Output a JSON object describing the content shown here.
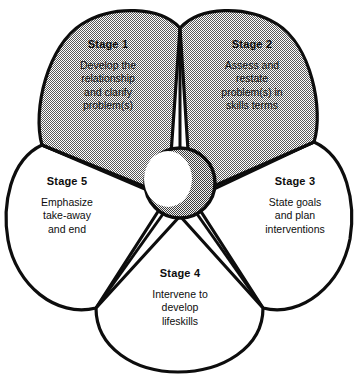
{
  "diagram": {
    "type": "five-stage-flower-cycle",
    "background_color": "#ffffff",
    "outline_color": "#0d0d0d",
    "shaded_fill_color": "#bdbdbd",
    "unshaded_fill_color": "#ffffff",
    "hub_fill_color": "#9a9a9a",
    "hub_highlight_color": "#ffffff",
    "petal_count": 5,
    "stages": [
      {
        "id": "stage-1",
        "title": "Stage 1",
        "lines": [
          "Develop the",
          "relationship",
          "and clarify",
          "problem(s)"
        ],
        "shaded": true,
        "position": "top-left"
      },
      {
        "id": "stage-2",
        "title": "Stage 2",
        "lines": [
          "Assess and",
          "restate",
          "problem(s) in",
          "skills terms"
        ],
        "shaded": true,
        "position": "top-right"
      },
      {
        "id": "stage-3",
        "title": "Stage 3",
        "lines": [
          "State goals",
          "and plan",
          "interventions"
        ],
        "shaded": false,
        "position": "right"
      },
      {
        "id": "stage-4",
        "title": "Stage 4",
        "lines": [
          "Intervene to",
          "develop",
          "lifeskills"
        ],
        "shaded": false,
        "position": "bottom"
      },
      {
        "id": "stage-5",
        "title": "Stage 5",
        "lines": [
          "Emphasize",
          "take-away",
          "and end"
        ],
        "shaded": false,
        "position": "left"
      }
    ]
  }
}
